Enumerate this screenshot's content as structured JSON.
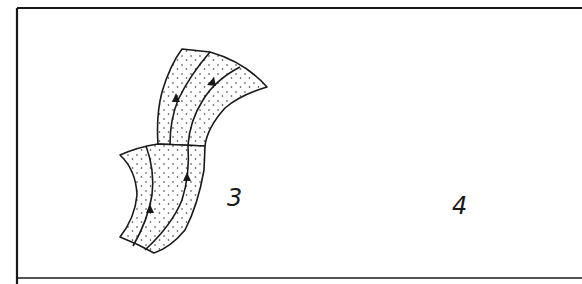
{
  "figure": {
    "type": "line drawing",
    "panels": [
      {
        "id": "3",
        "label": "3",
        "description": "S-curved stippled strip made of two stacked segments with flow lines and upward arrows"
      },
      {
        "id": "4",
        "label": "4",
        "description": "S-shaped stippled band with two curled arc segments, internal flow lines and direction arrows"
      }
    ],
    "colors": {
      "stroke": "#1a1a1a",
      "fill": "#ffffff",
      "stipple": "#333333"
    }
  }
}
